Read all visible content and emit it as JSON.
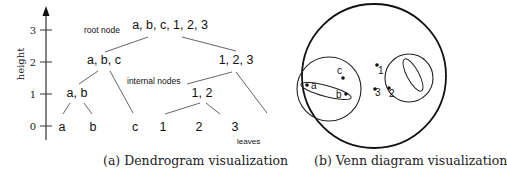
{
  "dendrogram": {
    "axis": {
      "label": "height",
      "ticks": [
        "0",
        "1",
        "2",
        "3"
      ]
    },
    "nodes": {
      "root": "a, b, c, 1, 2, 3",
      "abc": "a, b, c",
      "n123": "1, 2, 3",
      "ab": "a, b",
      "n12": "1, 2",
      "leaf_a": "a",
      "leaf_b": "b",
      "leaf_c": "c",
      "leaf_1": "1",
      "leaf_2": "2",
      "leaf_3": "3"
    },
    "annotations": {
      "root_node": "root node",
      "internal_nodes": "internal nodes",
      "leaves": "leaves"
    },
    "caption": "(a) Dendrogram visualization"
  },
  "venn": {
    "points": {
      "a": "a",
      "b": "b",
      "c": "c",
      "p1": "1",
      "p2": "2",
      "p3": "3"
    },
    "caption": "(b) Venn diagram visualization"
  },
  "colors": {
    "line": "#111111",
    "thin_line": "#555555",
    "background": "#ffffff"
  }
}
